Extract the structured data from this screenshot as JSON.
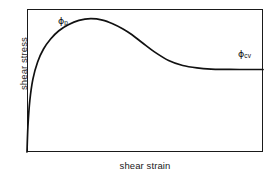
{
  "figure": {
    "background_color": "#ffffff",
    "line_color": "#111111",
    "frame_color": "#1a1a1a"
  },
  "axes": {
    "y_title": "shear stress",
    "x_title": "shear strain"
  },
  "annotations": {
    "peak": {
      "symbol": "ϕ",
      "subscript": "p"
    },
    "critical": {
      "symbol": "ϕ",
      "subscript": "cv"
    }
  },
  "chart_data": {
    "type": "line",
    "title": "",
    "xlabel": "shear strain",
    "ylabel": "shear stress",
    "xlim": [
      0,
      1
    ],
    "ylim": [
      0,
      1
    ],
    "grid": false,
    "legend": null,
    "axis_ticks": {
      "x": [],
      "y": []
    },
    "annotations": [
      {
        "text": "ϕp",
        "label": "peak shear stress",
        "x": 0.26,
        "y": 0.92
      },
      {
        "text": "ϕcv",
        "label": "constant volume (critical state) shear stress",
        "x": 0.9,
        "y": 0.66
      }
    ],
    "series": [
      {
        "name": "dense sand shear stress response",
        "x": [
          0.0,
          0.004,
          0.012,
          0.025,
          0.045,
          0.07,
          0.1,
          0.135,
          0.175,
          0.22,
          0.27,
          0.32,
          0.365,
          0.405,
          0.445,
          0.49,
          0.54,
          0.6,
          0.66,
          0.72,
          0.78,
          0.84,
          0.9,
          0.95,
          1.0
        ],
        "y": [
          0.0,
          0.18,
          0.36,
          0.51,
          0.63,
          0.72,
          0.79,
          0.848,
          0.89,
          0.92,
          0.932,
          0.922,
          0.895,
          0.862,
          0.82,
          0.762,
          0.7,
          0.64,
          0.605,
          0.588,
          0.58,
          0.578,
          0.577,
          0.577,
          0.577
        ]
      }
    ],
    "features": {
      "peak_stress_normalized": 0.932,
      "peak_strain_normalized": 0.275,
      "residual_stress_normalized": 0.577
    }
  }
}
